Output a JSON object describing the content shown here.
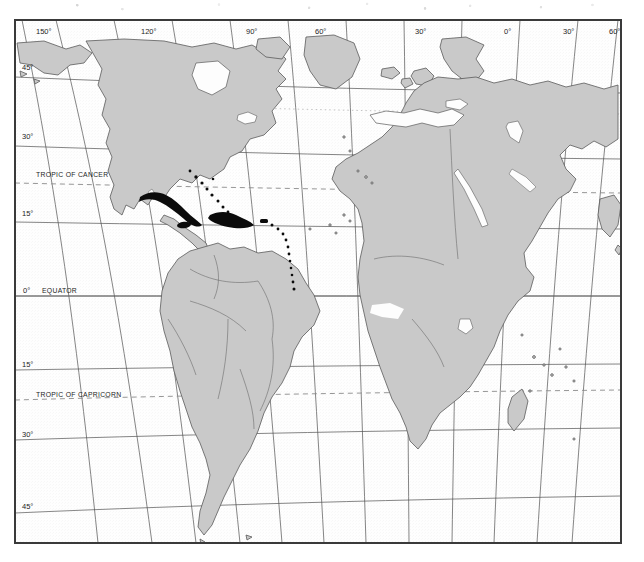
{
  "document": {
    "type": "scanned-figure",
    "title": "World distribution map",
    "background_color": "#ffffff"
  },
  "map": {
    "name": "world-distribution-map",
    "projection": "oblique-curved-graticule",
    "frame_color": "#404040",
    "ocean_color": "#ffffff",
    "land_color": "#c8c8c8",
    "land_outline_color": "#555555",
    "graticule_color": "#4a4a4a",
    "special_line_color": "#7a7a7a",
    "distribution_color": "#0a0a0a",
    "frame": {
      "x": 14,
      "y": 19,
      "width": 608,
      "height": 525
    },
    "longitude_labels": [
      {
        "text": "150°",
        "x": 40,
        "y": 32
      },
      {
        "text": "120°",
        "x": 145,
        "y": 32
      },
      {
        "text": "90°",
        "x": 250,
        "y": 32
      },
      {
        "text": "60°",
        "x": 318,
        "y": 32
      },
      {
        "text": "30°",
        "x": 418,
        "y": 32
      },
      {
        "text": "0°",
        "x": 508,
        "y": 32
      },
      {
        "text": "30°",
        "x": 566,
        "y": 32
      },
      {
        "text": "60°",
        "x": 629,
        "y": 32
      }
    ],
    "latitude_labels": [
      {
        "text": "45°",
        "x": 26,
        "y": 67
      },
      {
        "text": "30°",
        "x": 26,
        "y": 136
      },
      {
        "text": "15°",
        "x": 26,
        "y": 213
      },
      {
        "text": "0°",
        "x": 26,
        "y": 290
      },
      {
        "text": "15°",
        "x": 26,
        "y": 360
      },
      {
        "text": "30°",
        "x": 26,
        "y": 430
      },
      {
        "text": "45°",
        "x": 26,
        "y": 504
      }
    ],
    "named_lines": [
      {
        "text": "TROPIC OF CANCER",
        "x": 36,
        "y": 174
      },
      {
        "text": "EQUATOR",
        "x": 42,
        "y": 290
      },
      {
        "text": "TROPIC OF CAPRICORN",
        "x": 36,
        "y": 394
      }
    ],
    "distribution_note": "Solid black shading marks the Greater Antilles: Cuba, Jamaica, Hispaniola and Puerto Rico, plus scattered dots through the Bahamas and Lesser Antilles.",
    "distribution_regions": [
      "Cuba",
      "Jamaica",
      "Hispaniola",
      "Puerto Rico",
      "Bahamas",
      "Lesser Antilles"
    ],
    "landmasses": [
      "North America",
      "South America",
      "Greenland",
      "Europe",
      "Africa",
      "Arabian Peninsula",
      "Madagascar",
      "western Asia"
    ]
  }
}
